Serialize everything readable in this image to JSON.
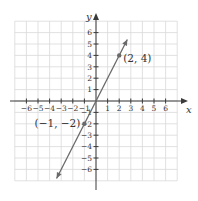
{
  "chart_data": {
    "type": "line",
    "title": "",
    "xlabel": "x",
    "ylabel": "y",
    "xlim": [
      -6.5,
      7
    ],
    "ylim": [
      -7,
      7
    ],
    "grid": true,
    "x_ticks": [
      -6,
      -5,
      -4,
      -3,
      -2,
      -1,
      1,
      2,
      3,
      4,
      5,
      6
    ],
    "y_ticks": [
      -6,
      -5,
      -4,
      -3,
      -2,
      -1,
      1,
      2,
      3,
      4,
      5,
      6
    ],
    "x_tick_labels": [
      "−6",
      "−5",
      "−4",
      "−3",
      "−2",
      "−1",
      "1",
      "2",
      "3",
      "4",
      "5",
      "6"
    ],
    "y_tick_labels": [
      "−6",
      "−5",
      "−4",
      "−3",
      "−2",
      "−1",
      "1",
      "2",
      "3",
      "4",
      "5",
      "6"
    ],
    "series": [
      {
        "name": "y = 2x",
        "slope": 2,
        "intercept": 0,
        "x": [
          -3.4,
          2.7
        ],
        "y": [
          -6.8,
          5.4
        ],
        "arrows": "both",
        "color": "#6a6a6a"
      }
    ],
    "points": [
      {
        "x": 2,
        "y": 4,
        "label": "(2, 4)"
      },
      {
        "x": -1,
        "y": -2,
        "label": "(−1, −2)"
      }
    ]
  },
  "axes": {
    "x_label": "x",
    "y_label": "y"
  },
  "colors": {
    "axis": "#3a3a3a",
    "grid": "#d9d9d9",
    "line": "#6a6a6a",
    "text": "#333333"
  }
}
